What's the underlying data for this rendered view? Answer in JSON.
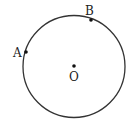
{
  "diagram": {
    "type": "circle-with-points",
    "circle": {
      "center_label": "O",
      "stroke": "#333333"
    },
    "points": [
      {
        "label": "A",
        "x": 26,
        "y": 52
      },
      {
        "label": "B",
        "x": 91,
        "y": 20
      },
      {
        "label": "O",
        "x": 74,
        "y": 66
      }
    ]
  }
}
